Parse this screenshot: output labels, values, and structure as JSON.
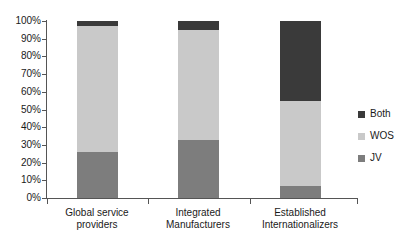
{
  "chart_data": {
    "type": "bar",
    "subtype": "stacked-percentage",
    "title": "",
    "xlabel": "",
    "ylabel": "",
    "ylim": [
      0,
      100
    ],
    "yunit": "%",
    "grid": false,
    "legend_position": "right",
    "categories": [
      "Global service providers",
      "Integrated Manufacturers",
      "Established Internationalizers"
    ],
    "category_lines": [
      [
        "Global service",
        "providers"
      ],
      [
        "Integrated",
        "Manufacturers"
      ],
      [
        "Established",
        "Internationalizers"
      ]
    ],
    "series": [
      {
        "name": "JV",
        "color": "#7d7d7d",
        "values": [
          26,
          33,
          7
        ]
      },
      {
        "name": "WOS",
        "color": "#c9c9c9",
        "values": [
          71,
          62,
          48
        ]
      },
      {
        "name": "Both",
        "color": "#3a3a3a",
        "values": [
          3,
          5,
          45
        ]
      }
    ],
    "ytick_labels": [
      "100%",
      "90%",
      "80%",
      "70%",
      "60%",
      "50%",
      "40%",
      "30%",
      "20%",
      "10%",
      "0%"
    ],
    "ytick_values": [
      100,
      90,
      80,
      70,
      60,
      50,
      40,
      30,
      20,
      10,
      0
    ]
  },
  "legend": {
    "entries": [
      {
        "label": "Both",
        "color": "#3a3a3a"
      },
      {
        "label": "WOS",
        "color": "#c9c9c9"
      },
      {
        "label": "JV",
        "color": "#7d7d7d"
      }
    ]
  }
}
